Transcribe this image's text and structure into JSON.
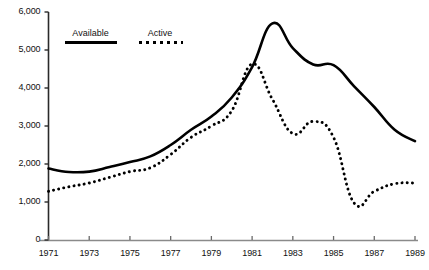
{
  "chart_data": {
    "type": "line",
    "title": "",
    "subtitle": "",
    "xlabel": "",
    "ylabel": "",
    "xlim": [
      1971,
      1989
    ],
    "ylim": [
      0,
      6000
    ],
    "grid": false,
    "legend_position": "top-left-inside",
    "x": [
      1971,
      1972,
      1973,
      1974,
      1975,
      1976,
      1977,
      1978,
      1979,
      1980,
      1981,
      1982,
      1983,
      1984,
      1985,
      1986,
      1987,
      1988,
      1989
    ],
    "x_tick_labels": [
      "1971",
      "1973",
      "1975",
      "1977",
      "1979",
      "1981",
      "1983",
      "1985",
      "1987",
      "1989"
    ],
    "x_ticks": [
      1971,
      1973,
      1975,
      1977,
      1979,
      1981,
      1983,
      1985,
      1987,
      1989
    ],
    "y_ticks": [
      0,
      1000,
      2000,
      3000,
      4000,
      5000,
      6000
    ],
    "y_tick_labels": [
      "0",
      "1,000",
      "2,000",
      "3,000",
      "4,000",
      "5,000",
      "6,000"
    ],
    "series": [
      {
        "name": "Available",
        "style": "solid",
        "color": "#000000",
        "values": [
          1880,
          1790,
          1800,
          1920,
          2050,
          2200,
          2500,
          2900,
          3250,
          3750,
          4550,
          5700,
          5050,
          4620,
          4600,
          4050,
          3500,
          2900,
          2600
        ]
      },
      {
        "name": "Active",
        "style": "dotted",
        "color": "#000000",
        "values": [
          1280,
          1400,
          1500,
          1650,
          1800,
          1900,
          2250,
          2700,
          3000,
          3400,
          4630,
          3700,
          2800,
          3120,
          2700,
          980,
          1280,
          1480,
          1500
        ]
      }
    ]
  },
  "legend": {
    "available_label": "Available",
    "active_label": "Active"
  },
  "axis": {
    "y_labels": [
      "6,000",
      "5,000",
      "4,000",
      "3,000",
      "2,000",
      "1,000",
      "0"
    ],
    "x_labels": [
      "1971",
      "1973",
      "1975",
      "1977",
      "1979",
      "1981",
      "1983",
      "1985",
      "1987",
      "1989"
    ]
  }
}
